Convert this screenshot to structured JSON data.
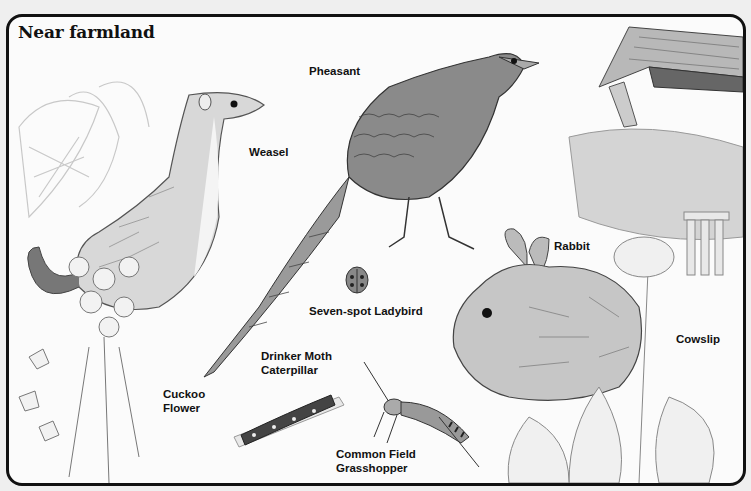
{
  "page": {
    "title": "Near farmland"
  },
  "labels": {
    "pheasant": "Pheasant",
    "weasel": "Weasel",
    "ladybird": "Seven-spot Ladybird",
    "rabbit": "Rabbit",
    "cowslip": "Cowslip",
    "drinker_moth": "Drinker Moth\nCaterpillar",
    "grasshopper": "Common Field\nGrasshopper",
    "cuckoo_flower": "Cuckoo\nFlower"
  },
  "colors": {
    "border": "#111111",
    "background": "#fbfbfb",
    "sketch_dark": "#3a3a3a",
    "sketch_mid": "#8a8a8a",
    "sketch_light": "#cfcfcf"
  }
}
